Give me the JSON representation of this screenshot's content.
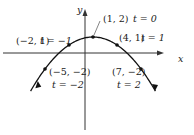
{
  "diagram": {
    "type": "parametric-curve",
    "axes": {
      "x_label": "x",
      "y_label": "y"
    },
    "points": [
      {
        "coord": "(1, 2)",
        "t": "t = 0"
      },
      {
        "coord": "(4, 1)",
        "t": "t = 1"
      },
      {
        "coord": "(−2, 1)",
        "t": "t = −1"
      },
      {
        "coord": "(−5, −2)",
        "t": "t = −2"
      },
      {
        "coord": "(7, −2)",
        "t": "t = 2"
      }
    ]
  },
  "chart_data": {
    "type": "line",
    "title": "",
    "xlabel": "x",
    "ylabel": "y",
    "series": [
      {
        "name": "parametric curve",
        "x": [
          -5,
          -2,
          1,
          4,
          7
        ],
        "y": [
          -2,
          1,
          2,
          1,
          -2
        ],
        "t": [
          -2,
          -1,
          0,
          1,
          2
        ]
      }
    ]
  }
}
